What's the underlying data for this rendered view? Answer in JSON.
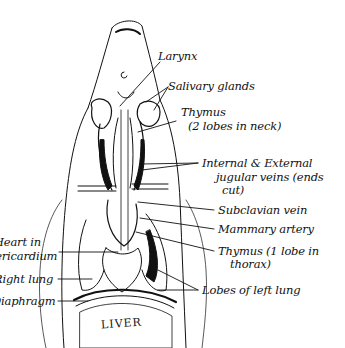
{
  "diagram": {
    "type": "anatomical-sketch",
    "labels_right": [
      {
        "id": "larynx",
        "text": "Larynx"
      },
      {
        "id": "salivary",
        "text": "Salivary glands"
      },
      {
        "id": "thymus_neck_1",
        "text": "Thymus"
      },
      {
        "id": "thymus_neck_2",
        "text": "(2 lobes in neck)"
      },
      {
        "id": "jugular_1",
        "text": "Internal & External"
      },
      {
        "id": "jugular_2",
        "text": "jugular veins (ends"
      },
      {
        "id": "jugular_3",
        "text": "cut)"
      },
      {
        "id": "subclavian",
        "text": "Subclavian vein"
      },
      {
        "id": "mammary",
        "text": "Mammary artery"
      },
      {
        "id": "thymus_thorax_1",
        "text": "Thymus (1 lobe in"
      },
      {
        "id": "thymus_thorax_2",
        "text": "thorax)"
      },
      {
        "id": "left_lung",
        "text": "Lobes of left lung"
      }
    ],
    "labels_left": [
      {
        "id": "heart_1",
        "text": "Heart in"
      },
      {
        "id": "heart_2",
        "text": "pericardium"
      },
      {
        "id": "right_lung",
        "text": "Right lung"
      },
      {
        "id": "diaphragm",
        "text": "Diaphragm"
      }
    ],
    "organ_label": "LIVER",
    "ink_color": "#111111",
    "background": "#ffffff"
  }
}
